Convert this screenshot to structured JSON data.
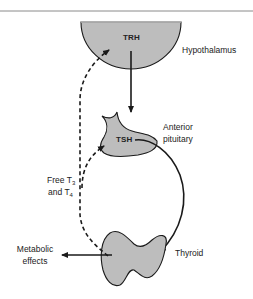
{
  "diagram": {
    "colors": {
      "organ_fill": "#bdbdbd",
      "stroke": "#1a1a1a",
      "rule": "#8a8a8a"
    },
    "organs": {
      "hypothalamus": {
        "hormone": "TRH",
        "label": "Hypothalamus"
      },
      "pituitary": {
        "hormone": "TSH",
        "label_line1": "Anterior",
        "label_line2": "pituitary"
      },
      "thyroid": {
        "label": "Thyroid"
      }
    },
    "feedback": {
      "line1_prefix": "Free T",
      "line1_sub": "3",
      "line2_prefix": "and T",
      "line2_sub": "4"
    },
    "output": {
      "line1": "Metabolic",
      "line2": "effects"
    }
  }
}
